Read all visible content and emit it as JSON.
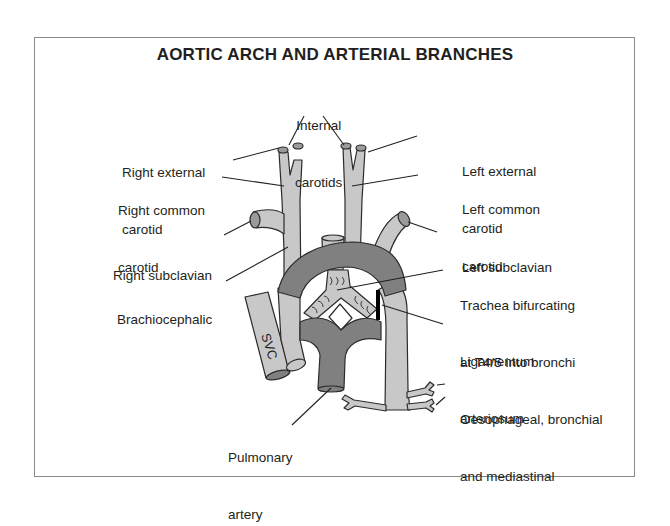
{
  "figure": {
    "title": "AORTIC ARCH AND ARTERIAL BRANCHES",
    "colors": {
      "vessel_light": "#c8c8c8",
      "vessel_dark": "#808080",
      "vessel_end": "#9a9a9a",
      "outline": "#2b2b2b",
      "ligament": "#000000",
      "frame_border": "#8a8a8a"
    },
    "labels": {
      "internal_carotids": {
        "line1": "Internal",
        "line2": "carotids"
      },
      "right_external_carotid": {
        "line1": "Right external",
        "line2": "carotid"
      },
      "left_external_carotid": {
        "line1": "Left external",
        "line2": "carotid"
      },
      "right_common_carotid": {
        "line1": "Right common",
        "line2": "carotid"
      },
      "left_common_carotid": {
        "line1": "Left common",
        "line2": "carotid"
      },
      "right_subclavian": {
        "line1": "Right subclavian"
      },
      "left_subclavian": {
        "line1": "Left subclavian"
      },
      "brachiocephalic": {
        "line1": "Brachiocephalic"
      },
      "trachea": {
        "line1": "Trachea bifurcating",
        "line2": "at T4/5 into bronchi"
      },
      "ligamentum": {
        "line1": "Ligamentum",
        "line2": "arteriosum"
      },
      "oesophageal": {
        "line1": "Oesophageal, bronchial",
        "line2": "and mediastinal"
      },
      "pulmonary_artery": {
        "line1": "Pulmonary",
        "line2": "artery"
      },
      "svc": "SVC"
    }
  }
}
